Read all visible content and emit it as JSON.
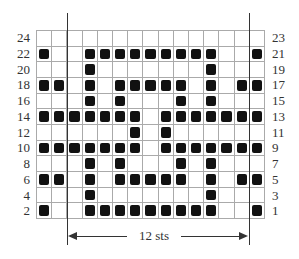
{
  "chart_data": {
    "type": "table",
    "title": "",
    "columns": 15,
    "rows": 12,
    "repeat_label": "12 sts",
    "repeat_start_col": 2,
    "repeat_end_col": 13,
    "left_row_labels": [
      "24",
      "22",
      "20",
      "18",
      "16",
      "14",
      "12",
      "10",
      "8",
      "6",
      "4",
      "2"
    ],
    "right_row_labels": [
      "23",
      "21",
      "19",
      "17",
      "15",
      "13",
      "11",
      "9",
      "7",
      "5",
      "3",
      "1"
    ],
    "grid": [
      [
        0,
        0,
        0,
        0,
        0,
        0,
        0,
        0,
        0,
        0,
        0,
        0,
        0,
        0,
        0
      ],
      [
        1,
        0,
        0,
        1,
        1,
        1,
        1,
        1,
        1,
        1,
        1,
        1,
        0,
        0,
        1
      ],
      [
        0,
        0,
        0,
        1,
        0,
        0,
        0,
        0,
        0,
        0,
        0,
        1,
        0,
        0,
        0
      ],
      [
        1,
        1,
        0,
        1,
        0,
        1,
        1,
        1,
        1,
        1,
        0,
        1,
        0,
        1,
        1
      ],
      [
        0,
        0,
        0,
        1,
        0,
        1,
        0,
        0,
        0,
        1,
        0,
        1,
        0,
        0,
        0
      ],
      [
        1,
        1,
        1,
        1,
        1,
        1,
        1,
        0,
        1,
        1,
        1,
        1,
        1,
        1,
        1
      ],
      [
        0,
        0,
        0,
        0,
        0,
        0,
        1,
        0,
        1,
        0,
        0,
        0,
        0,
        0,
        0
      ],
      [
        1,
        1,
        1,
        1,
        1,
        1,
        1,
        0,
        1,
        1,
        1,
        1,
        1,
        1,
        1
      ],
      [
        0,
        0,
        0,
        1,
        0,
        1,
        0,
        0,
        0,
        1,
        0,
        1,
        0,
        0,
        0
      ],
      [
        1,
        1,
        0,
        1,
        0,
        1,
        1,
        1,
        1,
        1,
        0,
        1,
        0,
        1,
        1
      ],
      [
        0,
        0,
        0,
        1,
        0,
        0,
        0,
        0,
        0,
        0,
        0,
        1,
        0,
        0,
        0
      ],
      [
        1,
        0,
        0,
        1,
        1,
        1,
        1,
        1,
        1,
        1,
        1,
        1,
        0,
        0,
        1
      ]
    ],
    "colors": {
      "filled": "#111111",
      "grid_line": "#aaaaaa",
      "empty": "#ffffff"
    }
  }
}
